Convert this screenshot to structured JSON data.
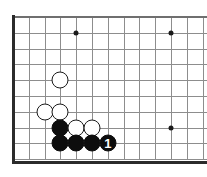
{
  "diagram": {
    "kind": "go-board",
    "board_size": 19,
    "view": "bottom-left corner",
    "colors": {
      "background": "#ffffff",
      "grid_line": "#8d8d8d",
      "board_edge": "#2b2b2b",
      "black_stone": "#0d0d0d",
      "white_stone": "#ffffff",
      "stone_outline": "#1a1a1a",
      "label_text": "#ffffff"
    },
    "geometry": {
      "origin_x": 13,
      "origin_y": 17,
      "cell": 15.8,
      "columns": 13,
      "rows": 10,
      "stone_diameter": 17,
      "star_point_diameter": 5
    },
    "star_points": [
      {
        "col": 4,
        "row": 1
      },
      {
        "col": 10,
        "row": 1
      },
      {
        "col": 10,
        "row": 7
      }
    ],
    "stones": [
      {
        "color": "white",
        "col": 3,
        "row": 4,
        "label": ""
      },
      {
        "color": "white",
        "col": 2,
        "row": 6,
        "label": ""
      },
      {
        "color": "white",
        "col": 3,
        "row": 6,
        "label": ""
      },
      {
        "color": "black",
        "col": 3,
        "row": 7,
        "label": ""
      },
      {
        "color": "white",
        "col": 4,
        "row": 7,
        "label": ""
      },
      {
        "color": "white",
        "col": 5,
        "row": 7,
        "label": ""
      },
      {
        "color": "black",
        "col": 3,
        "row": 8,
        "label": ""
      },
      {
        "color": "black",
        "col": 4,
        "row": 8,
        "label": ""
      },
      {
        "color": "black",
        "col": 5,
        "row": 8,
        "label": ""
      },
      {
        "color": "black",
        "col": 6,
        "row": 8,
        "label": "1"
      }
    ]
  }
}
